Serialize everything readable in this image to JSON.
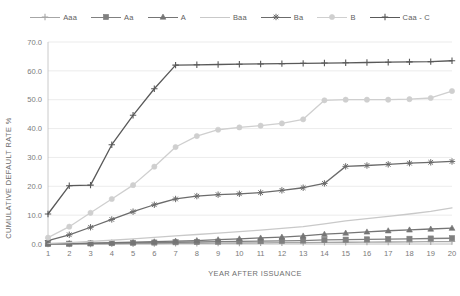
{
  "chart_data": {
    "type": "line",
    "title": "",
    "xlabel": "YEAR AFTER ISSUANCE",
    "ylabel": "CUMULATIVE DEFAULT RATE %",
    "x": [
      1,
      2,
      3,
      4,
      5,
      6,
      7,
      8,
      9,
      10,
      11,
      12,
      13,
      14,
      15,
      16,
      17,
      18,
      19,
      20
    ],
    "xtick_labels": [
      "1",
      "2",
      "3",
      "4",
      "5",
      "6",
      "7",
      "8",
      "9",
      "10",
      "11",
      "12",
      "13",
      "14",
      "15",
      "16",
      "17",
      "18",
      "19",
      "20"
    ],
    "ytick_labels": [
      "0.0",
      "10.0",
      "20.0",
      "30.0",
      "40.0",
      "50.0",
      "60.0",
      "70.0"
    ],
    "ylim": [
      0,
      70
    ],
    "ytick_step": 10,
    "grid": true,
    "legend_position": "top",
    "series": [
      {
        "name": "Aaa",
        "color": "#a6a6a6",
        "marker": "plus",
        "values": [
          0.0,
          0.0,
          0.0,
          0.05,
          0.1,
          0.15,
          0.2,
          0.25,
          0.3,
          0.35,
          0.4,
          0.45,
          0.5,
          0.55,
          0.6,
          0.65,
          0.7,
          0.75,
          0.8,
          0.85
        ]
      },
      {
        "name": "Aa",
        "color": "#808080",
        "marker": "square",
        "values": [
          0.05,
          0.1,
          0.2,
          0.3,
          0.4,
          0.5,
          0.6,
          0.7,
          0.8,
          0.9,
          1.0,
          1.1,
          1.2,
          1.4,
          1.5,
          1.6,
          1.7,
          1.8,
          1.9,
          2.0
        ]
      },
      {
        "name": "A",
        "color": "#757575",
        "marker": "triangle",
        "values": [
          0.05,
          0.15,
          0.3,
          0.45,
          0.6,
          0.8,
          1.0,
          1.2,
          1.5,
          1.8,
          2.1,
          2.4,
          2.8,
          3.4,
          3.8,
          4.2,
          4.6,
          4.9,
          5.2,
          5.5
        ]
      },
      {
        "name": "Baa",
        "color": "#c9c9c9",
        "marker": "none",
        "values": [
          0.2,
          0.5,
          0.9,
          1.3,
          1.8,
          2.3,
          2.8,
          3.3,
          3.8,
          4.3,
          4.8,
          5.4,
          6.0,
          7.0,
          8.0,
          8.8,
          9.6,
          10.4,
          11.3,
          12.5
        ]
      },
      {
        "name": "Ba",
        "color": "#6b6b6b",
        "marker": "star",
        "values": [
          1.2,
          3.2,
          5.8,
          8.5,
          11.2,
          13.6,
          15.6,
          16.6,
          17.1,
          17.4,
          17.8,
          18.6,
          19.5,
          21.0,
          26.9,
          27.2,
          27.6,
          28.0,
          28.3,
          28.6
        ]
      },
      {
        "name": "B",
        "color": "#cfcfcf",
        "marker": "circle",
        "values": [
          2.2,
          6.0,
          10.8,
          15.6,
          20.4,
          26.8,
          33.6,
          37.4,
          39.6,
          40.4,
          41.0,
          41.8,
          43.2,
          49.8,
          50.0,
          50.0,
          50.0,
          50.2,
          50.6,
          53.0
        ]
      },
      {
        "name": "Caa - C",
        "color": "#595959",
        "marker": "plus",
        "values": [
          10.4,
          20.2,
          20.4,
          34.4,
          44.6,
          53.8,
          62.0,
          62.1,
          62.2,
          62.3,
          62.4,
          62.5,
          62.6,
          62.7,
          62.8,
          62.9,
          63.0,
          63.1,
          63.2,
          63.5
        ]
      }
    ]
  },
  "legend": {
    "items": [
      {
        "label": "Aaa"
      },
      {
        "label": "Aa"
      },
      {
        "label": "A"
      },
      {
        "label": "Baa"
      },
      {
        "label": "Ba"
      },
      {
        "label": "B"
      },
      {
        "label": "Caa - C"
      }
    ]
  }
}
